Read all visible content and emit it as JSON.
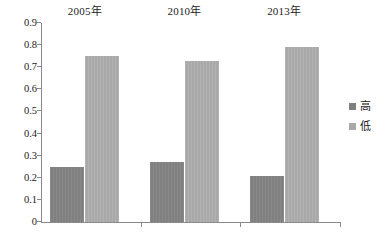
{
  "chart_data": {
    "type": "bar",
    "title": "",
    "subtitle": "",
    "xlabel": "",
    "ylabel": "",
    "categories": [
      "2005年",
      "2010年",
      "2013年"
    ],
    "series": [
      {
        "name": "高",
        "values": [
          0.25,
          0.27,
          0.21
        ],
        "color": "#808080"
      },
      {
        "name": "低",
        "values": [
          0.75,
          0.73,
          0.79
        ],
        "color": "#a9a9a9"
      }
    ],
    "ylim": [
      0,
      0.9
    ],
    "ytick_labels": [
      "0.9",
      "0.8",
      "0.7",
      "0.6",
      "0.5",
      "0.4",
      "0.3",
      "0.2",
      "0.1",
      "0"
    ],
    "ytick_values": [
      0.9,
      0.8,
      0.7,
      0.6,
      0.5,
      0.4,
      0.3,
      0.2,
      0.1,
      0
    ],
    "grid": false,
    "legend_position": "right",
    "category_label_position": "top"
  },
  "colors": {
    "axis": "#8a8a8a",
    "text": "#1b1b1b",
    "background": "#ffffff",
    "high": "#808080",
    "low": "#a9a9a9"
  }
}
